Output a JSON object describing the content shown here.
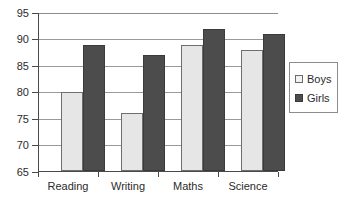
{
  "chart_data": {
    "type": "bar",
    "title": "",
    "xlabel": "",
    "ylabel": "",
    "ylim": [
      65,
      95
    ],
    "ytick_step": 5,
    "yticks": [
      65,
      70,
      75,
      80,
      85,
      90,
      95
    ],
    "grid": true,
    "legend_position": "right",
    "categories": [
      "Reading",
      "Writing",
      "Maths",
      "Science"
    ],
    "series": [
      {
        "name": "Boys",
        "color": "#e6e6e6",
        "values": [
          80,
          76,
          89,
          88
        ]
      },
      {
        "name": "Girls",
        "color": "#4c4c4c",
        "values": [
          89,
          87,
          92,
          91
        ]
      }
    ]
  },
  "legend": {
    "items": [
      {
        "label": "Boys"
      },
      {
        "label": "Girls"
      }
    ]
  },
  "axis": {
    "y_tick_labels": [
      "95",
      "90",
      "85",
      "80",
      "75",
      "70",
      "65"
    ],
    "x_tick_labels": [
      "Reading",
      "Writing",
      "Maths",
      "Science"
    ]
  }
}
